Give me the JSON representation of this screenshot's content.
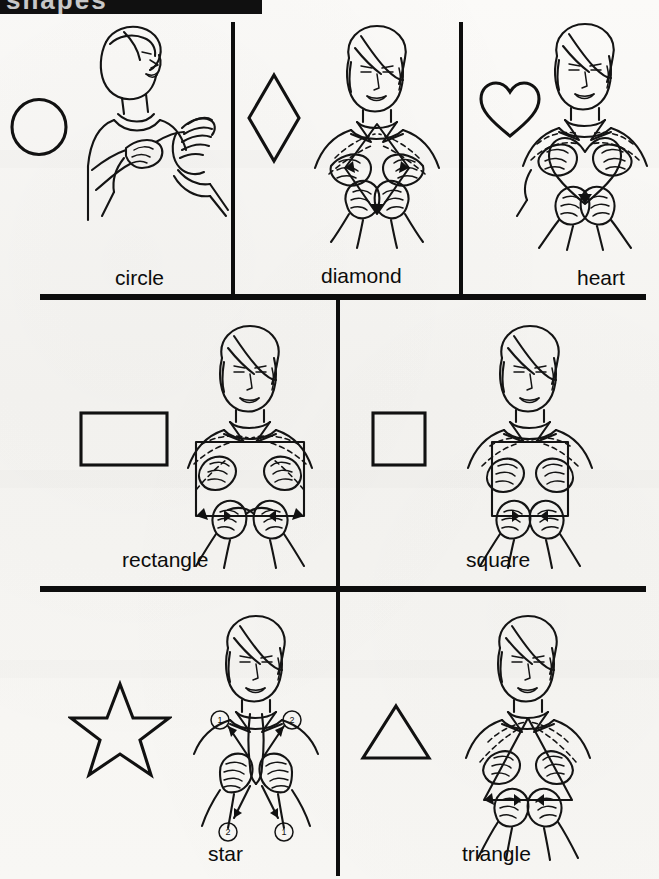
{
  "page": {
    "title": "Shapes",
    "header_bar": {
      "visible": true,
      "cropped_text": "shapes"
    },
    "background_color": "#f7f6f3",
    "ink_color": "#111111",
    "width": 659,
    "height": 879
  },
  "grid": {
    "rows": 3,
    "row1_count": 3,
    "row2_count": 2,
    "row3_count": 2
  },
  "entries": [
    {
      "id": "circle",
      "label": "circle",
      "shape_icon": "circle-outline",
      "row": 1,
      "column": 1,
      "sign_description": "One-handed sign: index finger traces a circle in the air next to a flat open hand.",
      "figure_view": "side-profile",
      "hands": "one-hand-traces",
      "motion_arrows": 0,
      "numbered_steps": []
    },
    {
      "id": "diamond",
      "label": "diamond",
      "shape_icon": "diamond-outline",
      "row": 1,
      "column": 2,
      "sign_description": "Two index fingers start together at the chest, trace outward and down, meeting again at the bottom to outline a diamond.",
      "figure_view": "front-facing",
      "hands": "two-hands-trace",
      "motion_arrows": 2,
      "numbered_steps": []
    },
    {
      "id": "heart",
      "label": "heart",
      "shape_icon": "heart-outline",
      "row": 1,
      "column": 3,
      "sign_description": "Two index fingers trace the curved lobes of a heart on the chest, meeting at the point below.",
      "figure_view": "front-facing",
      "hands": "two-hands-trace",
      "motion_arrows": 2,
      "numbered_steps": []
    },
    {
      "id": "rectangle",
      "label": "rectangle",
      "shape_icon": "rectangle-outline",
      "row": 2,
      "column": 1,
      "sign_description": "Index fingers start together at top center, move apart and down the sides, then inward along the bottom edge of a wide rectangle.",
      "figure_view": "front-facing",
      "hands": "two-hands-trace",
      "motion_arrows": 4,
      "numbered_steps": []
    },
    {
      "id": "square",
      "label": "square",
      "shape_icon": "square-outline",
      "row": 2,
      "column": 2,
      "sign_description": "Index fingers trace a square: apart across the top, down the sides, then inward along the bottom.",
      "figure_view": "front-facing",
      "hands": "two-hands-trace",
      "motion_arrows": 4,
      "numbered_steps": []
    },
    {
      "id": "star",
      "label": "star",
      "shape_icon": "star-outline",
      "row": 3,
      "column": 1,
      "sign_description": "Index fingers point up side by side, then alternately move up and outward, repeating in two numbered steps.",
      "figure_view": "front-facing",
      "hands": "two-hands-alternating",
      "motion_arrows": 4,
      "numbered_steps": [
        "1",
        "2",
        "2",
        "1"
      ]
    },
    {
      "id": "triangle",
      "label": "triangle",
      "shape_icon": "triangle-outline",
      "row": 3,
      "column": 2,
      "sign_description": "Index fingers start together at the apex, trace down and outward along the two slanted sides, then inward along the base.",
      "figure_view": "front-facing",
      "hands": "two-hands-trace",
      "motion_arrows": 3,
      "numbered_steps": []
    }
  ]
}
